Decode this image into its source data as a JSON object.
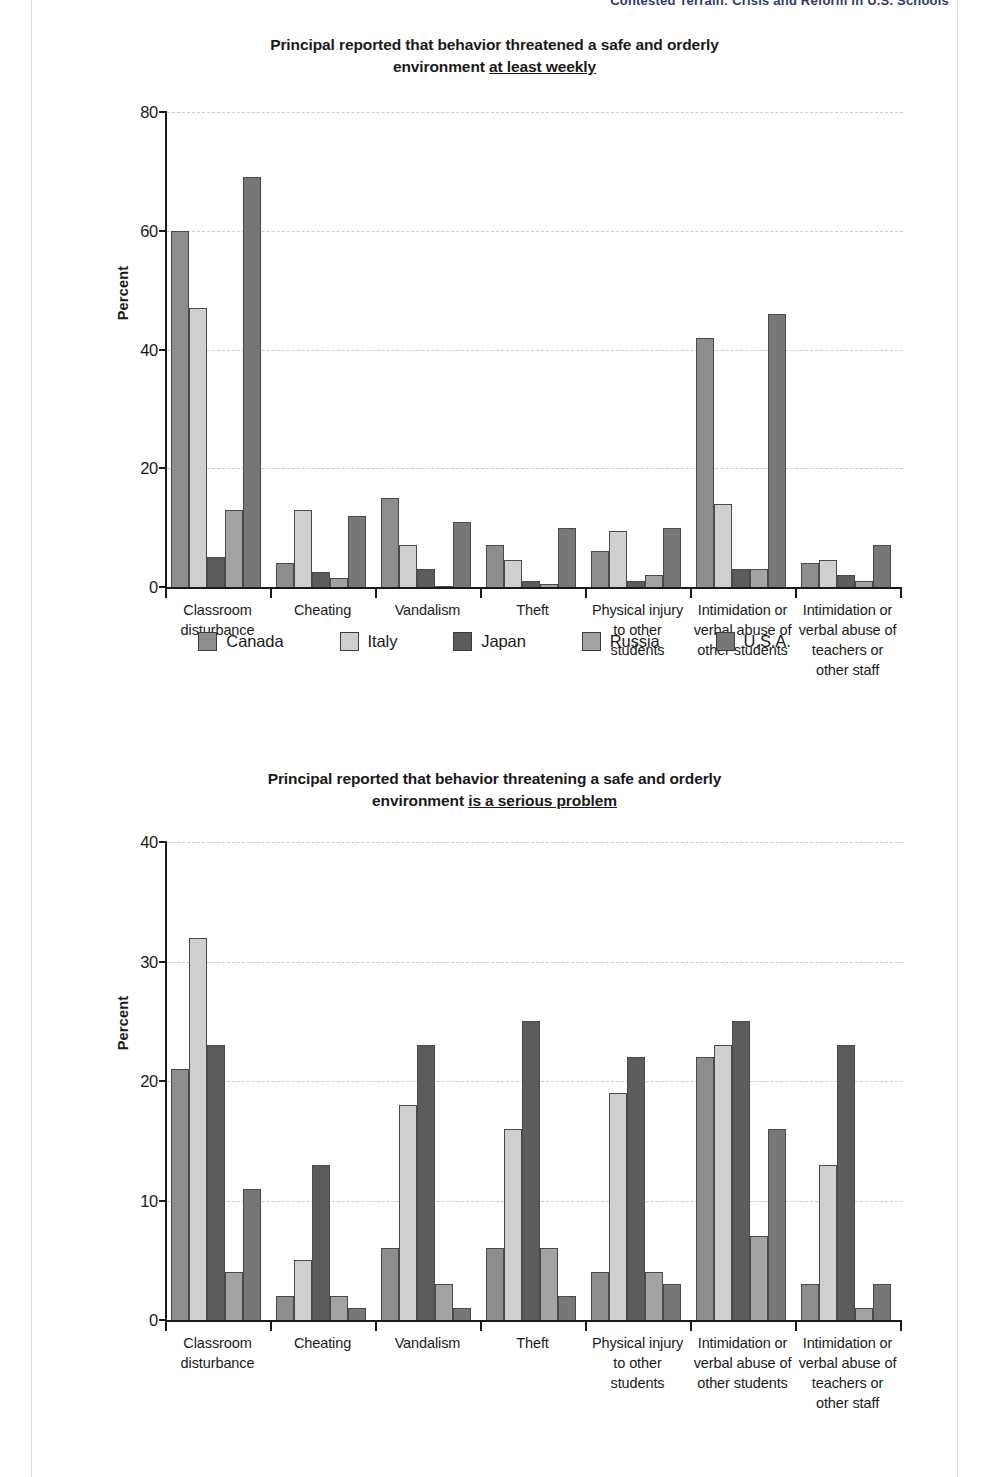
{
  "running_head": "Contested Terrain: Crisis and Reform in U.S. Schools",
  "series": [
    {
      "name": "Canada",
      "color": "#8d8d8d"
    },
    {
      "name": "Italy",
      "color": "#cfcfcf"
    },
    {
      "name": "Japan",
      "color": "#5c5c5c"
    },
    {
      "name": "Russia",
      "color": "#a3a3a3"
    },
    {
      "name": "U.S.A.",
      "color": "#777777"
    }
  ],
  "legend": {
    "items": [
      {
        "label": "Canada"
      },
      {
        "label": "Italy"
      },
      {
        "label": "Japan"
      },
      {
        "label": "Russia"
      },
      {
        "label": "U.S.A."
      }
    ]
  },
  "figure1": {
    "title_line1": "Principal reported that behavior threatened a safe and orderly",
    "title_line2_prefix": "environment ",
    "title_line2_underlined": "at least weekly",
    "ylabel": "Percent",
    "yticks": [
      "0",
      "20",
      "40",
      "60",
      "80"
    ]
  },
  "figure2": {
    "title_line1": "Principal reported that behavior threatening a safe and orderly",
    "title_line2_prefix": "environment ",
    "title_line2_underlined": "is a serious problem",
    "ylabel": "Percent",
    "yticks": [
      "0",
      "10",
      "20",
      "30",
      "40"
    ]
  },
  "chart_data": [
    {
      "id": "figure1",
      "type": "bar",
      "title": "Principal reported that behavior threatened a safe and orderly environment at least weekly",
      "xlabel": "",
      "ylabel": "Percent",
      "ylim": [
        0,
        80
      ],
      "ytick_values": [
        0,
        20,
        40,
        60,
        80
      ],
      "grid": true,
      "legend_position": "bottom",
      "categories": [
        "Classroom disturbance",
        "Cheating",
        "Vandalism",
        "Theft",
        "Physical injury to other students",
        "Intimidation or verbal abuse of other students",
        "Intimidation or verbal abuse of teachers or other staff"
      ],
      "series": [
        {
          "name": "Canada",
          "values": [
            60,
            4,
            15,
            7,
            6,
            42,
            4
          ]
        },
        {
          "name": "Italy",
          "values": [
            47,
            13,
            7,
            4.5,
            9.5,
            14,
            4.5
          ]
        },
        {
          "name": "Japan",
          "values": [
            5,
            2.5,
            3,
            1,
            1,
            3,
            2
          ]
        },
        {
          "name": "Russia",
          "values": [
            13,
            1.5,
            0,
            0.5,
            2,
            3,
            1
          ]
        },
        {
          "name": "U.S.A.",
          "values": [
            69,
            12,
            11,
            10,
            10,
            46,
            7
          ]
        }
      ]
    },
    {
      "id": "figure2",
      "type": "bar",
      "title": "Principal reported that behavior threatening a safe and orderly environment is a serious problem",
      "xlabel": "",
      "ylabel": "Percent",
      "ylim": [
        0,
        40
      ],
      "ytick_values": [
        0,
        10,
        20,
        30,
        40
      ],
      "grid": true,
      "legend_position": "bottom",
      "categories": [
        "Classroom disturbance",
        "Cheating",
        "Vandalism",
        "Theft",
        "Physical injury to other students",
        "Intimidation or verbal abuse of other students",
        "Intimidation or verbal abuse of teachers or other staff"
      ],
      "series": [
        {
          "name": "Canada",
          "values": [
            21,
            2,
            6,
            6,
            4,
            22,
            3
          ]
        },
        {
          "name": "Italy",
          "values": [
            32,
            5,
            18,
            16,
            19,
            23,
            13
          ]
        },
        {
          "name": "Japan",
          "values": [
            23,
            13,
            23,
            25,
            22,
            25,
            23
          ]
        },
        {
          "name": "Russia",
          "values": [
            4,
            2,
            3,
            6,
            4,
            7,
            1
          ]
        },
        {
          "name": "U.S.A.",
          "values": [
            11,
            1,
            1,
            2,
            3,
            16,
            3
          ]
        }
      ]
    }
  ]
}
